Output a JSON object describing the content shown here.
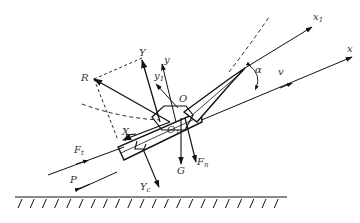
{
  "diagram": {
    "labels": {
      "x1": "x",
      "x1_sub": "1",
      "x": "x",
      "v": "v",
      "alpha": "α",
      "Y": "Y",
      "y": "y",
      "y1": "y",
      "y1_sub": "1",
      "R": "R",
      "O": "O",
      "O1": "O",
      "O1_sub": "1",
      "X": "X",
      "Ft": "F",
      "Ft_sub": "t",
      "P": "P",
      "Yc": "Y",
      "Yc_sub": "c",
      "G": "G",
      "Fn": "F",
      "Fn_sub": "n"
    },
    "colors": {
      "stroke": "#111111",
      "label": "#333333",
      "background": "#ffffff"
    }
  }
}
